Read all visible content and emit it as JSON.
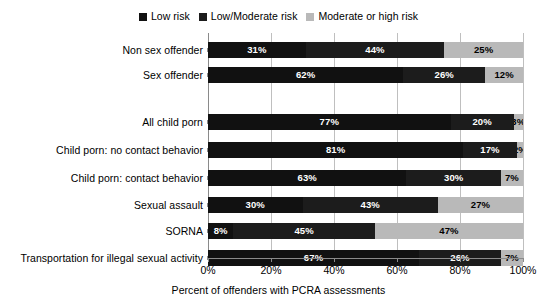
{
  "chart_data": {
    "type": "bar",
    "title": "",
    "subtitle": "",
    "xlabel": "Percent of offenders with PCRA assessments",
    "ylabel": "",
    "orientation": "horizontal",
    "stacked": true,
    "normalized": true,
    "xlim": [
      0,
      100
    ],
    "xticks": [
      0,
      20,
      40,
      60,
      80,
      100
    ],
    "xtick_labels": [
      "0%",
      "20%",
      "40%",
      "60%",
      "80%",
      "100%"
    ],
    "grid": "vertical",
    "legend_position": "top-center",
    "categories": [
      "Non sex offender",
      "Sex offender",
      "All child porn",
      "Child porn: no contact behavior",
      "Child porn: contact behavior",
      "Sexual assault",
      "SORNA",
      "Transportation for illegal sexual activity"
    ],
    "series": [
      {
        "name": "Low risk",
        "color": "#111111",
        "values": [
          31,
          62,
          77,
          81,
          63,
          30,
          8,
          67
        ],
        "labels": [
          "31%",
          "62%",
          "77%",
          "81%",
          "63%",
          "30%",
          "8%",
          "67%"
        ]
      },
      {
        "name": "Low/Moderate risk",
        "color": "#1c1c1c",
        "values": [
          44,
          26,
          20,
          17,
          30,
          43,
          45,
          26
        ],
        "labels": [
          "44%",
          "26%",
          "20%",
          "17%",
          "30%",
          "43%",
          "45%",
          "26%"
        ]
      },
      {
        "name": "Moderate or high risk",
        "color": "#b9b9b9",
        "values": [
          25,
          12,
          3,
          2,
          7,
          27,
          47,
          7
        ],
        "labels": [
          "25%",
          "12%",
          "3%",
          "2%",
          "7%",
          "27%",
          "47%",
          "7%"
        ]
      }
    ]
  },
  "legend": {
    "entries": [
      {
        "label": "Low risk",
        "color": "#111111"
      },
      {
        "label": "Low/Moderate risk",
        "color": "#1c1c1c"
      },
      {
        "label": "Moderate or high risk",
        "color": "#b9b9b9"
      }
    ]
  },
  "axis": {
    "x_title": "Percent of offenders with PCRA assessments",
    "tick_labels": [
      "0%",
      "20%",
      "40%",
      "60%",
      "80%",
      "100%"
    ]
  }
}
